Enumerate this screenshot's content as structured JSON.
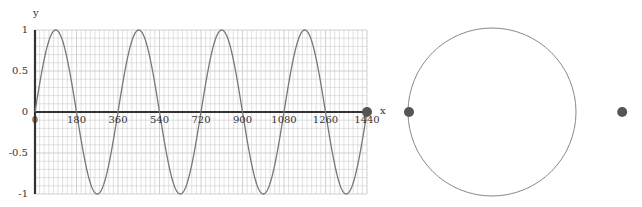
{
  "chart_data": {
    "type": "line",
    "title": "",
    "xlabel": "x",
    "ylabel": "y",
    "xlim": [
      0,
      1440
    ],
    "ylim": [
      -1,
      1
    ],
    "grid": true,
    "x_ticks": [
      "0",
      "180",
      "360",
      "540",
      "720",
      "900",
      "1080",
      "1260",
      "1440"
    ],
    "y_ticks": [
      "1",
      "0.5",
      "0",
      "-0.5",
      "-1"
    ],
    "series": [
      {
        "name": "sin(x°)",
        "function": "sin",
        "x": [
          0,
          90,
          180,
          270,
          360,
          450,
          540,
          630,
          720,
          810,
          900,
          990,
          1080,
          1170,
          1260,
          1350,
          1440
        ],
        "values": [
          0,
          1,
          0,
          -1,
          0,
          1,
          0,
          -1,
          0,
          1,
          0,
          -1,
          0,
          1,
          0,
          -1,
          0
        ]
      }
    ],
    "markers": [
      {
        "name": "point-on-x-axis",
        "x": 1440,
        "y": 0
      }
    ],
    "unit_circle": {
      "radius": 1,
      "markers": [
        {
          "name": "point-on-circle",
          "angle_deg": 180
        },
        {
          "name": "point-outside-circle",
          "relative_x": 1.55
        }
      ]
    }
  },
  "colors": {
    "curve": "#777777",
    "axis": "#333333",
    "grid": "#cccccc",
    "circle": "#888888",
    "dot": "#555555"
  }
}
